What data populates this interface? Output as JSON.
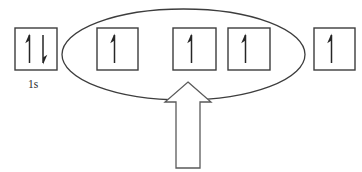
{
  "diagram": {
    "canvas": {
      "width": 362,
      "height": 172
    },
    "colors": {
      "background": "#ffffff",
      "box_stroke": "#3d3d3d",
      "ellipse_stroke": "#3d3d3d",
      "arrow_stroke": "#262626",
      "block_arrow_stroke": "#5a5a5a",
      "block_arrow_fill": "#ffffff",
      "label_text": "#2b2b2b"
    },
    "boxes": [
      {
        "id": "box-1s",
        "label": "1s",
        "electrons": 2,
        "spins": [
          "up",
          "down"
        ],
        "inside_group": false,
        "x": 15,
        "y": 28,
        "width": 42,
        "height": 42
      },
      {
        "id": "box-2",
        "label": "",
        "electrons": 1,
        "spins": [
          "up"
        ],
        "inside_group": true,
        "x": 97,
        "y": 28,
        "width": 41,
        "height": 42
      },
      {
        "id": "box-3",
        "label": "",
        "electrons": 1,
        "spins": [
          "up"
        ],
        "inside_group": true,
        "x": 173,
        "y": 28,
        "width": 43,
        "height": 42
      },
      {
        "id": "box-4",
        "label": "",
        "electrons": 1,
        "spins": [
          "up"
        ],
        "inside_group": true,
        "x": 228,
        "y": 28,
        "width": 42,
        "height": 42
      },
      {
        "id": "box-5",
        "label": "",
        "electrons": 1,
        "spins": [
          "up"
        ],
        "inside_group": false,
        "x": 314,
        "y": 28,
        "width": 41,
        "height": 42
      }
    ],
    "ellipse": {
      "name": "degenerate-orbital-grouping",
      "cx": 183.5,
      "cy": 54.5,
      "rx": 121.5,
      "ry": 45.5
    },
    "pointer_arrow": {
      "name": "callout-arrow",
      "direction": "up",
      "apex_x": 188,
      "apex_y": 82,
      "head_half_width": 23,
      "head_bottom_y": 102,
      "shaft_half_width": 12,
      "shaft_bottom_y": 168
    },
    "labels": [
      {
        "id": "label-1s",
        "text": "1s",
        "x": 36,
        "y": 84
      }
    ]
  }
}
